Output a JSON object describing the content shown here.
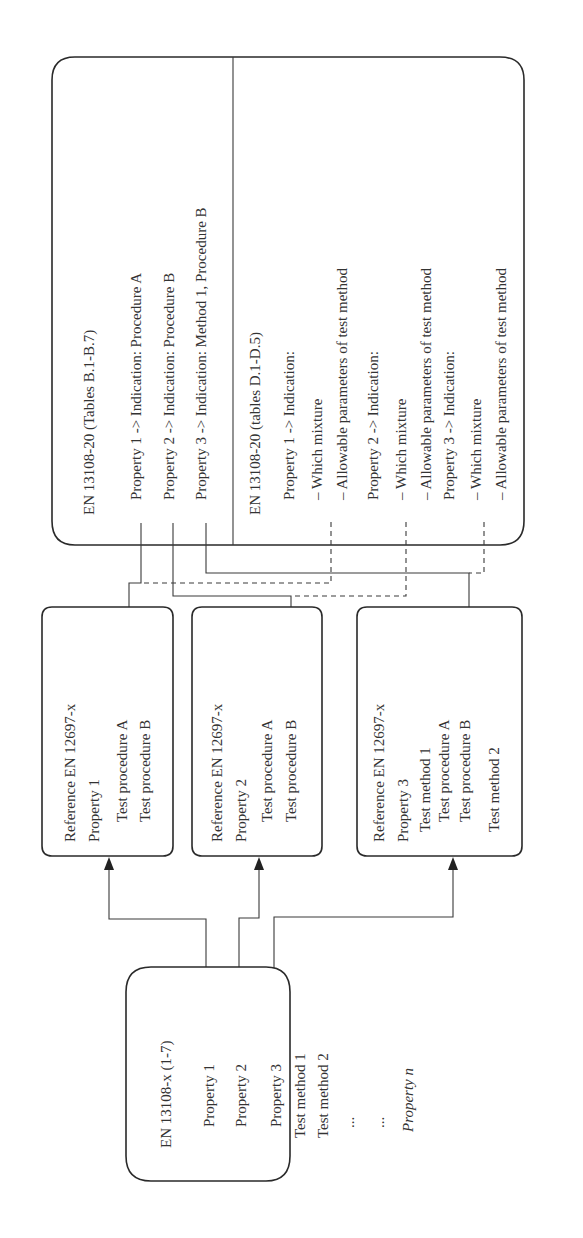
{
  "diagram": {
    "orientation": "rotated 90 degrees counter-clockwise",
    "source_box": {
      "title": "EN 13108-x (1-7)",
      "lines": [
        "Property 1",
        "Property 2",
        "Property 3",
        "Test method 1",
        "Test method 2",
        "...",
        "...",
        "Property n"
      ]
    },
    "reference_boxes": [
      {
        "title": "Reference EN 12697-x",
        "lines": [
          "Property 1",
          "Test procedure A",
          "Test procedure B"
        ]
      },
      {
        "title": "Reference EN 12697-x",
        "lines": [
          "Property 2",
          "Test procedure A",
          "Test procedure B"
        ]
      },
      {
        "title": "Reference EN 12697-x",
        "lines": [
          "Property 3",
          "Test method 1",
          "Test procedure A",
          "Test procedure B",
          "Test method 2",
          "Test procedure A",
          "Test procedure B"
        ]
      }
    ],
    "en13108_20_box": {
      "section_b": {
        "title": "EN 13108-20 (Tables B.1-B.7)",
        "lines": [
          "Property 1 -> Indication: Procedure A",
          "Property 2 -> Indication: Procedure B",
          "Property 3 -> Indication: Method 1, Procedure B"
        ]
      },
      "section_d": {
        "title": "EN 13108-20 (tables D.1-D.5)",
        "lines": [
          "Property 1 -> Indication:",
          "– Which mixture",
          "– Allowable parameters of test method",
          "Property 2 -> Indication:",
          "– Which mixture",
          "– Allowable parameters of test method",
          "Property 3 -> Indication:",
          "– Which mixture",
          "– Allowable parameters of test method"
        ]
      }
    },
    "connectors": [
      {
        "from": "source Property 1",
        "to": "reference box 1",
        "style": "solid",
        "arrow": true
      },
      {
        "from": "source Property 2",
        "to": "reference box 2",
        "style": "solid",
        "arrow": true
      },
      {
        "from": "source Property 3",
        "to": "reference box 3",
        "style": "solid",
        "arrow": true
      },
      {
        "from": "EN 13108-20 B Property 1",
        "to": "reference box 1",
        "style": "solid",
        "arrow": true
      },
      {
        "from": "EN 13108-20 B Property 2",
        "to": "reference box 2",
        "style": "solid",
        "arrow": true
      },
      {
        "from": "EN 13108-20 B Property 3",
        "to": "reference box 3",
        "style": "solid",
        "arrow": true
      },
      {
        "from": "EN 13108-20 D Property 1",
        "to": "reference box 1",
        "style": "dashed",
        "arrow": false
      },
      {
        "from": "EN 13108-20 D Property 2",
        "to": "reference box 2",
        "style": "dashed",
        "arrow": false
      },
      {
        "from": "EN 13108-20 D Property 3",
        "to": "reference box 3",
        "style": "dashed",
        "arrow": false
      }
    ]
  }
}
